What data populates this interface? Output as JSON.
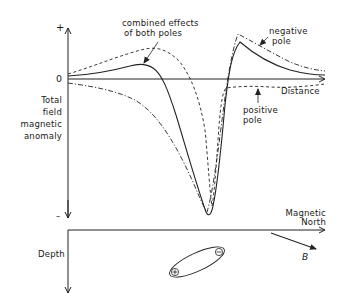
{
  "diagram": {
    "upper_plot": {
      "y_axis": {
        "plus_label": "+",
        "zero_label": "0",
        "minus_label": "–",
        "title_lines": [
          "Total",
          "field",
          "magnetic",
          "anomaly"
        ]
      },
      "x_axis": {
        "label": "Distance"
      },
      "annotations": {
        "combined_lines": [
          "combined effects",
          "of both poles"
        ],
        "negative_lines": [
          "negative",
          "pole"
        ],
        "positive_lines": [
          "positive",
          "pole"
        ]
      },
      "curves": [
        {
          "name": "combined effects of both poles",
          "style": "solid"
        },
        {
          "name": "negative pole",
          "style": "dash-dot"
        },
        {
          "name": "positive pole",
          "style": "dashed"
        }
      ]
    },
    "lower_plot": {
      "x_axis": {
        "label_lines": [
          "Magnetic",
          "North"
        ]
      },
      "y_axis": {
        "label": "Depth"
      },
      "body": {
        "positive_symbol": "⊕",
        "negative_symbol": "⊖"
      },
      "field_vector": {
        "label": "B"
      }
    },
    "colors": {
      "line": "#222222",
      "background": "#ffffff"
    }
  }
}
